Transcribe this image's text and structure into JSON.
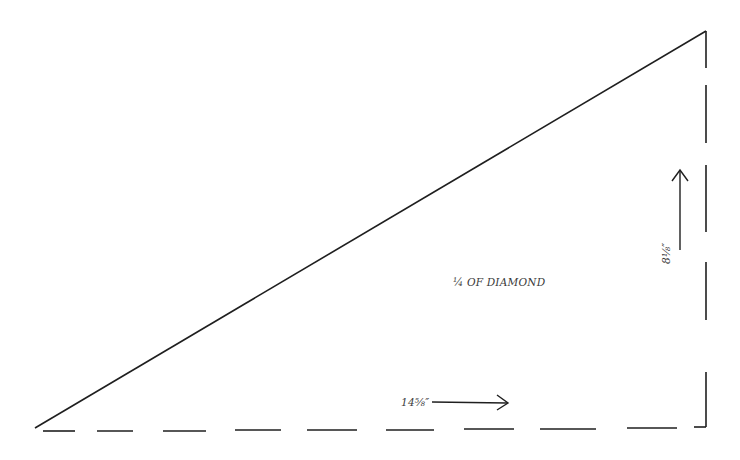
{
  "diagram": {
    "title": "¼ OF DIAMOND",
    "shape": "right-triangle pattern piece",
    "stroke_color": "#1f1f1f",
    "text_color": "#3a3a3a",
    "labels": {
      "center": "¼ OF DIAMOND",
      "width": "14⅝″",
      "height": "8⅛″"
    },
    "edges": {
      "hypotenuse": "solid",
      "bottom": "dashed (fold line)",
      "right": "dashed (fold line)"
    },
    "arrows": {
      "width_arrow": "right",
      "height_arrow": "up"
    }
  }
}
